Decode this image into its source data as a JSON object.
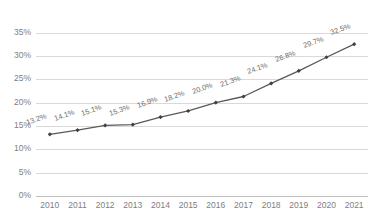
{
  "chart_data": {
    "type": "line",
    "title": "",
    "xlabel": "",
    "ylabel": "",
    "categories": [
      "2010",
      "2011",
      "2012",
      "2013",
      "2014",
      "2015",
      "2016",
      "2017",
      "2018",
      "2019",
      "2020",
      "2021"
    ],
    "values": [
      13.2,
      14.1,
      15.1,
      15.3,
      16.9,
      18.2,
      20.0,
      21.3,
      24.1,
      26.8,
      29.7,
      32.5
    ],
    "data_labels": [
      "13.2%",
      "14.1%",
      "15.1%",
      "15.3%",
      "16.9%",
      "18.2%",
      "20.0%",
      "21.3%",
      "24.1%",
      "26.8%",
      "29.7%",
      "32.5%"
    ],
    "ylim": [
      0,
      35
    ],
    "ytick_values": [
      35,
      30,
      25,
      20,
      15,
      10,
      5,
      0
    ],
    "ytick_labels": [
      "35%",
      "30%",
      "25%",
      "20%",
      "15%",
      "10%",
      "5%",
      "0%"
    ],
    "grid": true,
    "legend": null,
    "series_name": "",
    "marker": "diamond",
    "label_rotation_deg": -20,
    "colors": {
      "line": "#595959",
      "marker": "#404040",
      "gridline": "#d9d9d9",
      "axis": "#bfbfbf",
      "tick_text": "#808080",
      "data_label_text": "#6e6e6e",
      "background": "#ffffff"
    }
  },
  "title_note": "title row is cropped off the top edge of the screenshot and is illegible"
}
